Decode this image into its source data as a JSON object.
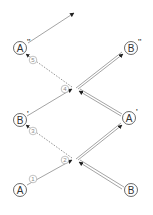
{
  "diagram": {
    "colors": {
      "line": "#9a9a9a",
      "arrow": "#222222",
      "node_stroke": "#444444",
      "step_stroke": "#999999"
    },
    "nodes": [
      {
        "id": "A",
        "letter": "A",
        "prime": "",
        "cx": 20,
        "cy": 190
      },
      {
        "id": "B",
        "letter": "B",
        "prime": "",
        "cx": 131,
        "cy": 190
      },
      {
        "id": "B1",
        "letter": "B",
        "prime": "'",
        "cx": 20,
        "cy": 120
      },
      {
        "id": "A1",
        "letter": "A",
        "prime": "'",
        "cx": 129,
        "cy": 118
      },
      {
        "id": "A2",
        "letter": "A",
        "prime": "''",
        "cx": 20,
        "cy": 48
      },
      {
        "id": "B2",
        "letter": "B",
        "prime": "''",
        "cx": 131,
        "cy": 48
      }
    ],
    "steps": [
      {
        "num": "1",
        "cx": 33,
        "cy": 179
      },
      {
        "num": "2",
        "cx": 65,
        "cy": 160
      },
      {
        "num": "3",
        "cx": 33,
        "cy": 131
      },
      {
        "num": "4",
        "cx": 65,
        "cy": 89
      },
      {
        "num": "5",
        "cx": 33,
        "cy": 60
      }
    ]
  }
}
